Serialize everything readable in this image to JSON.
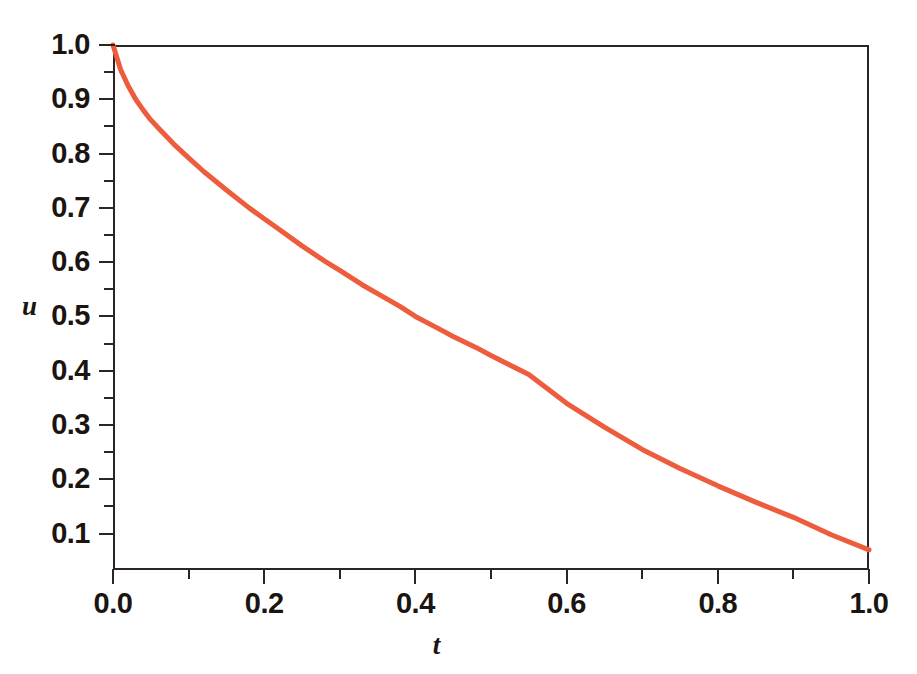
{
  "figure": {
    "background_color": "#ffffff",
    "frame_color": "#2b2623",
    "curve_color": "#ee5c3e"
  },
  "axes": {
    "x_title": "t",
    "y_title": "u",
    "x_tick_labels": [
      "0.0",
      "0.2",
      "0.4",
      "0.6",
      "0.8",
      "1.0"
    ],
    "y_tick_labels": [
      "1.0",
      "0.9",
      "0.8",
      "0.7",
      "0.6",
      "0.5",
      "0.4",
      "0.3",
      "0.2",
      "0.1"
    ]
  },
  "chart_data": {
    "type": "line",
    "title": "",
    "subtitle": "",
    "xlabel": "t",
    "ylabel": "u",
    "xlim": [
      0.0,
      1.0
    ],
    "ylim": [
      0.033,
      1.0
    ],
    "x_ticks": [
      0.0,
      0.2,
      0.4,
      0.6,
      0.8,
      1.0
    ],
    "x_minor_ticks": [
      0.1,
      0.3,
      0.5,
      0.7,
      0.9
    ],
    "y_ticks": [
      0.1,
      0.2,
      0.3,
      0.4,
      0.5,
      0.6,
      0.7,
      0.8,
      0.9,
      1.0
    ],
    "y_minor_ticks": [
      0.15,
      0.25,
      0.35,
      0.45,
      0.55,
      0.65,
      0.75,
      0.85,
      0.95
    ],
    "grid": false,
    "legend": false,
    "legend_position": "none",
    "series": [
      {
        "name": "u(t)",
        "color": "#ee5c3e",
        "line_width": 5,
        "x": [
          0.0,
          0.01,
          0.02,
          0.03,
          0.04,
          0.05,
          0.06,
          0.08,
          0.1,
          0.12,
          0.15,
          0.18,
          0.2,
          0.22,
          0.25,
          0.28,
          0.3,
          0.33,
          0.35,
          0.38,
          0.4,
          0.43,
          0.45,
          0.48,
          0.5,
          0.55,
          0.6,
          0.65,
          0.7,
          0.75,
          0.8,
          0.85,
          0.9,
          0.95,
          1.0
        ],
        "y": [
          1.0,
          0.955,
          0.925,
          0.9,
          0.88,
          0.862,
          0.847,
          0.818,
          0.792,
          0.767,
          0.733,
          0.7,
          0.68,
          0.66,
          0.63,
          0.602,
          0.585,
          0.558,
          0.542,
          0.518,
          0.5,
          0.478,
          0.463,
          0.443,
          0.428,
          0.393,
          0.34,
          0.296,
          0.255,
          0.22,
          0.188,
          0.158,
          0.13,
          0.098,
          0.07
        ]
      }
    ]
  }
}
